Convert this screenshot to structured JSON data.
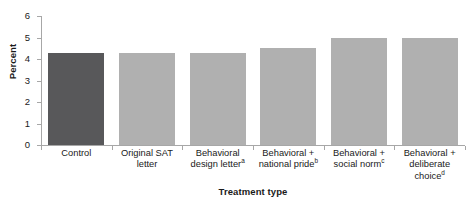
{
  "chart_data": {
    "type": "bar",
    "title": "",
    "xlabel": "Treatment type",
    "ylabel": "Percent",
    "categories": [
      "Control",
      "Original SAT letter",
      "Behavioral design letter",
      "Behavioral + national pride",
      "Behavioral + social norm",
      "Behavioral + deliberate choice"
    ],
    "category_lines": [
      [
        "Control"
      ],
      [
        "Original SAT",
        "letter"
      ],
      [
        "Behavioral",
        "design letter"
      ],
      [
        "Behavioral +",
        "national pride"
      ],
      [
        "Behavioral +",
        "social norm"
      ],
      [
        "Behavioral +",
        "deliberate",
        "choice"
      ]
    ],
    "category_footnotes": [
      "",
      "",
      "a",
      "b",
      "c",
      "d"
    ],
    "values": [
      4.3,
      4.3,
      4.3,
      4.5,
      5.0,
      5.0
    ],
    "ylim": [
      0,
      6
    ],
    "yticks": [
      0,
      1,
      2,
      3,
      4,
      5,
      6
    ],
    "ytick_labels": [
      "0",
      "1",
      "2",
      "3",
      "4",
      "5",
      "6"
    ],
    "grid": false,
    "legend": "none",
    "bar_colors": [
      "#58585a",
      "#b0b0b0",
      "#b0b0b0",
      "#b0b0b0",
      "#b0b0b0",
      "#b0b0b0"
    ],
    "highlight_color": "#58585a",
    "series_color": "#b0b0b0",
    "axis_color": "#a7a7a7"
  }
}
